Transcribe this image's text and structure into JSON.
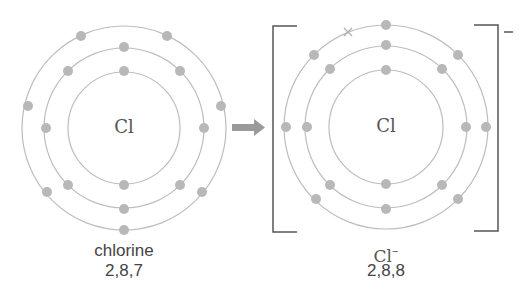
{
  "diagram": {
    "colors": {
      "shell": "#bdbdbd",
      "electron": "#b8b8b8",
      "text": "#444444",
      "bracket": "#555555",
      "arrow": "#9a9a9a"
    },
    "atom": {
      "symbol": "Cl",
      "name": "chlorine",
      "configuration": "2,8,7",
      "shells": [
        2,
        8,
        7
      ]
    },
    "arrow": "right-arrow",
    "ion": {
      "symbol": "Cl",
      "charge_superscript": "−",
      "bracket_charge": "−",
      "configuration": "2,8,8",
      "shells": [
        2,
        8,
        8
      ],
      "gained_electron_marker": "×"
    }
  }
}
